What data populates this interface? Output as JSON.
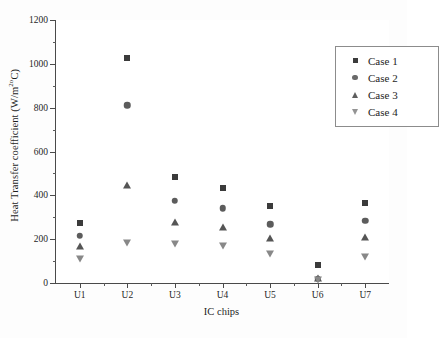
{
  "chart_data": {
    "type": "scatter",
    "title": "",
    "xlabel": "IC chips",
    "ylabel": "Heat Transfer coefficient (W/m2oC)",
    "ylabel_main": "Heat Transfer coefficient (W/m",
    "ylabel_sup1": "2",
    "ylabel_sup2": "o",
    "ylabel_tail": "C)",
    "categories": [
      "U1",
      "U2",
      "U3",
      "U4",
      "U5",
      "U6",
      "U7"
    ],
    "ylim": [
      0,
      1200
    ],
    "yticks": [
      0,
      200,
      400,
      600,
      800,
      1000,
      1200
    ],
    "ytick_labels": [
      "0",
      "200",
      "400",
      "600",
      "800",
      "1000",
      "1200"
    ],
    "yminor_step": 100,
    "grid": false,
    "legend_position": "top-right",
    "series": [
      {
        "name": "Case 1",
        "marker": "square",
        "color": "#3b3b3b",
        "values": [
          275,
          1028,
          482,
          432,
          350,
          83,
          365
        ]
      },
      {
        "name": "Case 2",
        "marker": "circle",
        "color": "#5c5c5c",
        "values": [
          215,
          810,
          375,
          340,
          267,
          20,
          283
        ]
      },
      {
        "name": "Case 3",
        "marker": "triangle-up",
        "color": "#555555",
        "values": [
          168,
          447,
          278,
          257,
          205,
          25,
          208
        ]
      },
      {
        "name": "Case 4",
        "marker": "triangle-down",
        "color": "#888888",
        "values": [
          108,
          183,
          178,
          167,
          133,
          12,
          120
        ]
      }
    ]
  },
  "legend": {
    "items": [
      {
        "label": "Case 1",
        "marker": "square"
      },
      {
        "label": "Case 2",
        "marker": "circle"
      },
      {
        "label": "Case 3",
        "marker": "triangle-up"
      },
      {
        "label": "Case 4",
        "marker": "triangle-down"
      }
    ]
  }
}
